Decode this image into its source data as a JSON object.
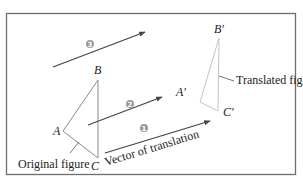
{
  "diagram": {
    "colors": {
      "frame": "#6e6e6e",
      "original_triangle": "#8a8a8a",
      "translated_triangle": "#c4c4c4",
      "vector": "#444444",
      "badge": "#9a9a9a",
      "text": "#222222"
    },
    "original_figure": {
      "label": "Original figure",
      "vertices": {
        "A": "A",
        "B": "B",
        "C": "C"
      }
    },
    "translated_figure": {
      "label": "Translated figure",
      "vertices": {
        "A": "A′",
        "B": "B′",
        "C": "C′"
      }
    },
    "vectors": [
      {
        "badge": "1",
        "label": "Vector of translation"
      },
      {
        "badge": "2"
      },
      {
        "badge": "3"
      }
    ]
  }
}
